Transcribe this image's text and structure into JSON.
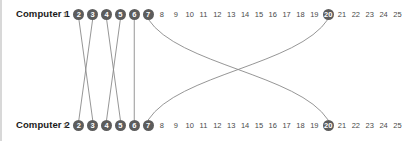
{
  "diagram": {
    "rows": [
      {
        "id": "computer-1",
        "label": "Computer 1",
        "y": 14,
        "numbers": [
          1,
          2,
          3,
          4,
          5,
          6,
          7,
          8,
          9,
          10,
          11,
          12,
          13,
          14,
          15,
          16,
          17,
          18,
          19,
          20,
          21,
          22,
          23,
          24,
          25
        ],
        "highlighted": [
          2,
          3,
          4,
          5,
          6,
          7,
          20
        ]
      },
      {
        "id": "computer-2",
        "label": "Computer 2",
        "y": 125,
        "numbers": [
          1,
          2,
          3,
          4,
          5,
          6,
          7,
          8,
          9,
          10,
          11,
          12,
          13,
          14,
          15,
          16,
          17,
          18,
          19,
          20,
          21,
          22,
          23,
          24,
          25
        ],
        "highlighted": [
          2,
          3,
          4,
          5,
          6,
          7,
          20
        ]
      }
    ],
    "edges": [
      {
        "from": 2,
        "to": 3,
        "style": "straight"
      },
      {
        "from": 3,
        "to": 2,
        "style": "straight"
      },
      {
        "from": 4,
        "to": 5,
        "style": "straight"
      },
      {
        "from": 5,
        "to": 4,
        "style": "straight"
      },
      {
        "from": 6,
        "to": 6,
        "style": "straight"
      },
      {
        "from": 7,
        "to": 20,
        "style": "curve"
      },
      {
        "from": 20,
        "to": 7,
        "style": "curve"
      }
    ],
    "colors": {
      "highlight_fill": "#5c5c5c",
      "highlight_text": "#ffffff",
      "plain_text": "#4a4a4a",
      "edge": "#8a8a8a",
      "label_text": "#1a1a1a",
      "background": "#ffffff",
      "left_border": "#d8d8d8"
    },
    "geometry": {
      "first_node_x": 63,
      "node_spacing": 13.85,
      "node_diameter": 11,
      "top_row_y": 14,
      "bottom_row_y": 125
    }
  }
}
